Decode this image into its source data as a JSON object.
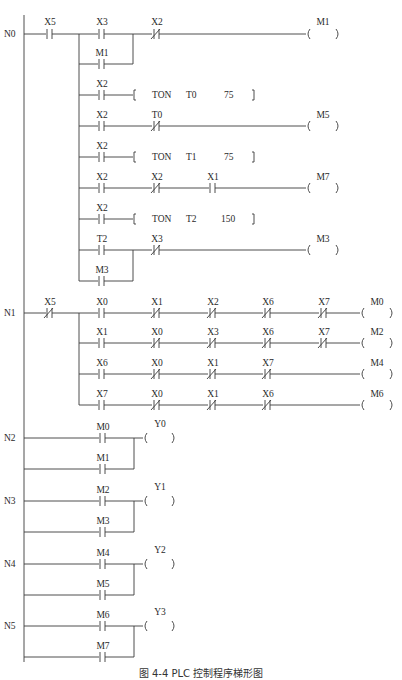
{
  "caption": "图 4-4  PLC 控制程序梯形图",
  "colors": {
    "line": "#3a3a3a",
    "text": "#2a2a2a",
    "background": "#ffffff"
  },
  "rungs": {
    "N0": {
      "label": "N0",
      "input_contact": {
        "name": "X5",
        "type": "NO"
      },
      "lines": [
        {
          "contacts": [
            {
              "name": "X3",
              "type": "NO"
            },
            {
              "name": "X2",
              "type": "NC"
            }
          ],
          "parallel": [
            {
              "name": "M1",
              "type": "NO"
            }
          ],
          "output": {
            "kind": "coil",
            "name": "M1"
          }
        },
        {
          "contacts": [
            {
              "name": "X2",
              "type": "NO"
            }
          ],
          "output": {
            "kind": "instruction",
            "op": "TON",
            "operand": "T0",
            "preset": "75"
          }
        },
        {
          "contacts": [
            {
              "name": "X2",
              "type": "NO"
            },
            {
              "name": "T0",
              "type": "NC"
            }
          ],
          "output": {
            "kind": "coil",
            "name": "M5"
          }
        },
        {
          "contacts": [
            {
              "name": "X2",
              "type": "NO"
            }
          ],
          "output": {
            "kind": "instruction",
            "op": "TON",
            "operand": "T1",
            "preset": "75"
          }
        },
        {
          "contacts": [
            {
              "name": "X2",
              "type": "NO"
            },
            {
              "name": "X2",
              "type": "NC"
            },
            {
              "name": "X1",
              "type": "NO"
            }
          ],
          "output": {
            "kind": "coil",
            "name": "M7"
          }
        },
        {
          "contacts": [
            {
              "name": "X2",
              "type": "NO"
            }
          ],
          "output": {
            "kind": "instruction",
            "op": "TON",
            "operand": "T2",
            "preset": "150"
          }
        },
        {
          "contacts": [
            {
              "name": "T2",
              "type": "NO"
            },
            {
              "name": "X3",
              "type": "NC"
            }
          ],
          "parallel": [
            {
              "name": "M3",
              "type": "NO"
            }
          ],
          "output": {
            "kind": "coil",
            "name": "M3"
          }
        }
      ]
    },
    "N1": {
      "label": "N1",
      "input_contact": {
        "name": "X5",
        "type": "NC"
      },
      "lines": [
        {
          "contacts": [
            {
              "name": "X0",
              "type": "NO"
            },
            {
              "name": "X1",
              "type": "NC"
            },
            {
              "name": "X2",
              "type": "NC"
            },
            {
              "name": "X6",
              "type": "NC"
            },
            {
              "name": "X7",
              "type": "NC"
            }
          ],
          "output": {
            "kind": "coil",
            "name": "M0"
          }
        },
        {
          "contacts": [
            {
              "name": "X1",
              "type": "NO"
            },
            {
              "name": "X0",
              "type": "NC"
            },
            {
              "name": "X3",
              "type": "NC"
            },
            {
              "name": "X6",
              "type": "NC"
            },
            {
              "name": "X7",
              "type": "NC"
            }
          ],
          "output": {
            "kind": "coil",
            "name": "M2"
          }
        },
        {
          "contacts": [
            {
              "name": "X6",
              "type": "NO"
            },
            {
              "name": "X0",
              "type": "NC"
            },
            {
              "name": "X1",
              "type": "NC"
            },
            {
              "name": "X7",
              "type": "NC"
            }
          ],
          "output": {
            "kind": "coil",
            "name": "M4"
          }
        },
        {
          "contacts": [
            {
              "name": "X7",
              "type": "NO"
            },
            {
              "name": "X0",
              "type": "NC"
            },
            {
              "name": "X1",
              "type": "NC"
            },
            {
              "name": "X6",
              "type": "NC"
            }
          ],
          "output": {
            "kind": "coil",
            "name": "M6"
          }
        }
      ]
    },
    "N2": {
      "label": "N2",
      "contacts": [
        {
          "name": "M0",
          "type": "NO"
        },
        {
          "name": "M1",
          "type": "NO"
        }
      ],
      "output": {
        "kind": "coil",
        "name": "Y0"
      }
    },
    "N3": {
      "label": "N3",
      "contacts": [
        {
          "name": "M2",
          "type": "NO"
        },
        {
          "name": "M3",
          "type": "NO"
        }
      ],
      "output": {
        "kind": "coil",
        "name": "Y1"
      }
    },
    "N4": {
      "label": "N4",
      "contacts": [
        {
          "name": "M4",
          "type": "NO"
        },
        {
          "name": "M5",
          "type": "NO"
        }
      ],
      "output": {
        "kind": "coil",
        "name": "Y2"
      }
    },
    "N5": {
      "label": "N5",
      "contacts": [
        {
          "name": "M6",
          "type": "NO"
        },
        {
          "name": "M7",
          "type": "NO"
        }
      ],
      "output": {
        "kind": "coil",
        "name": "Y3"
      }
    }
  }
}
